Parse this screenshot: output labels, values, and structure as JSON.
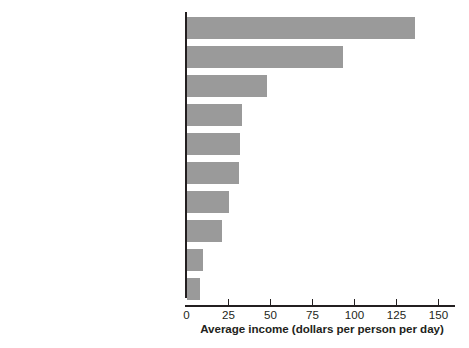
{
  "chart_data": {
    "type": "bar",
    "orientation": "horizontal",
    "title": "",
    "xlabel": "Average income (dollars per person per day)",
    "ylabel": "",
    "xlim": [
      0,
      160
    ],
    "xticks": [
      0,
      25,
      50,
      75,
      100,
      125,
      150
    ],
    "xtick_labels": [
      "0",
      "25",
      "50",
      "75",
      "100",
      "125",
      "150"
    ],
    "grid": false,
    "legend": false,
    "bar_color": "#9a9a9a",
    "axis_color": "#231f20",
    "categories": [
      "United States",
      "Euro area",
      "Russia",
      "Latin America and the Caribbean",
      "Brazil",
      "South Africa",
      "China",
      "Middle East",
      "India",
      "Africa"
    ],
    "values": [
      136,
      93,
      48,
      33,
      32,
      31,
      25,
      21,
      10,
      8
    ]
  }
}
